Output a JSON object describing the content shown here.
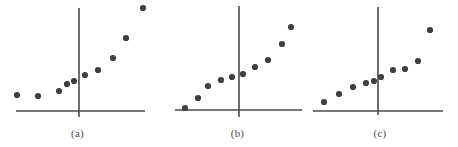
{
  "figure": {
    "width": 458,
    "height": 147,
    "background": "#ffffff",
    "dot_color": "#3f3f3f",
    "axis_color": "#4a4a4a",
    "label_color": "#4a4a4a",
    "dot_radius": 3.1,
    "axis_width": 1.6
  },
  "chart_data": [
    {
      "type": "scatter",
      "title": "(a)",
      "xlabel": "",
      "ylabel": "",
      "grid": false,
      "legend": null,
      "axis_style": "crossed-axes-origin",
      "origin_px": {
        "x": 79,
        "y": 111
      },
      "x_axis_px": {
        "x1": 16,
        "x2": 145,
        "y": 111
      },
      "y_axis_px": {
        "y1": 8,
        "y2": 117,
        "x": 79
      },
      "n_points": 10,
      "points_px": [
        {
          "x": 17,
          "y": 95
        },
        {
          "x": 38,
          "y": 96
        },
        {
          "x": 59,
          "y": 91
        },
        {
          "x": 67,
          "y": 84
        },
        {
          "x": 74,
          "y": 81
        },
        {
          "x": 85,
          "y": 75
        },
        {
          "x": 98,
          "y": 70
        },
        {
          "x": 113,
          "y": 58
        },
        {
          "x": 126,
          "y": 38
        },
        {
          "x": 143,
          "y": 8
        }
      ],
      "x": [
        -8.8,
        -6.1,
        -3.4,
        -2.4,
        -1.5,
        -0.1,
        1.6,
        3.5,
        5.2,
        7.4
      ],
      "y": [
        2.1,
        2.0,
        2.6,
        3.5,
        3.9,
        4.7,
        5.3,
        6.9,
        9.5,
        13.4
      ]
    },
    {
      "type": "scatter",
      "title": "(b)",
      "xlabel": "",
      "ylabel": "",
      "grid": false,
      "legend": null,
      "axis_style": "crossed-axes-origin",
      "origin_px": {
        "x": 239,
        "y": 110
      },
      "x_axis_px": {
        "x1": 175,
        "x2": 302,
        "y": 110
      },
      "y_axis_px": {
        "y1": 6,
        "y2": 117,
        "x": 239
      },
      "n_points": 10,
      "points_px": [
        {
          "x": 185,
          "y": 108
        },
        {
          "x": 198,
          "y": 98
        },
        {
          "x": 208,
          "y": 86
        },
        {
          "x": 221,
          "y": 80
        },
        {
          "x": 232,
          "y": 77
        },
        {
          "x": 243,
          "y": 74
        },
        {
          "x": 255,
          "y": 67
        },
        {
          "x": 268,
          "y": 60
        },
        {
          "x": 282,
          "y": 44
        },
        {
          "x": 291,
          "y": 27
        }
      ],
      "x": [
        -7.0,
        -5.3,
        -4.0,
        -2.3,
        -0.9,
        0.5,
        2.1,
        3.8,
        5.6,
        6.8
      ],
      "y": [
        0.3,
        1.6,
        3.1,
        3.9,
        4.3,
        4.7,
        5.6,
        6.5,
        8.6,
        10.8
      ]
    },
    {
      "type": "scatter",
      "title": "(c)",
      "xlabel": "",
      "ylabel": "",
      "grid": false,
      "legend": null,
      "axis_style": "crossed-axes-origin",
      "origin_px": {
        "x": 378,
        "y": 111
      },
      "x_axis_px": {
        "x1": 313,
        "x2": 443,
        "y": 111
      },
      "y_axis_px": {
        "y1": 7,
        "y2": 115,
        "x": 378
      },
      "n_points": 10,
      "points_px": [
        {
          "x": 324,
          "y": 102
        },
        {
          "x": 339,
          "y": 94
        },
        {
          "x": 353,
          "y": 87
        },
        {
          "x": 366,
          "y": 83
        },
        {
          "x": 374,
          "y": 81
        },
        {
          "x": 381,
          "y": 77
        },
        {
          "x": 393,
          "y": 70
        },
        {
          "x": 405,
          "y": 69
        },
        {
          "x": 418,
          "y": 61
        },
        {
          "x": 430,
          "y": 30
        }
      ],
      "x": [
        -7.0,
        -5.1,
        -3.3,
        -1.6,
        -0.5,
        0.4,
        1.9,
        3.5,
        5.2,
        6.7
      ],
      "y": [
        1.2,
        2.2,
        3.1,
        3.6,
        3.9,
        4.4,
        5.3,
        5.4,
        6.5,
        10.4
      ]
    }
  ],
  "panels": [
    {
      "id": "panel-a",
      "label": "(a)",
      "left": 0,
      "width": 155,
      "label_top": 127
    },
    {
      "id": "panel-b",
      "label": "(b)",
      "left": 158,
      "width": 150,
      "label_top": 127
    },
    {
      "id": "panel-c",
      "label": "(c)",
      "left": 305,
      "width": 150,
      "label_top": 127
    }
  ]
}
